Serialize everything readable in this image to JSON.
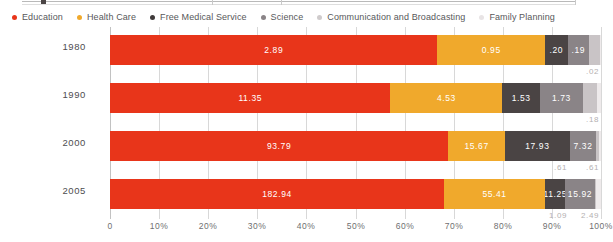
{
  "chart_data": {
    "type": "bar",
    "subtype": "stacked-horizontal-100pct",
    "title": "",
    "xlabel": "",
    "ylabel": "",
    "xlim": [
      0,
      100
    ],
    "xticks": [
      "0",
      "10%",
      "20%",
      "30%",
      "40%",
      "50%",
      "60%",
      "70%",
      "80%",
      "90%",
      "100%"
    ],
    "grid": true,
    "legend_position": "top",
    "categories": [
      "1980",
      "1990",
      "2000",
      "2005"
    ],
    "series": [
      {
        "name": "Education",
        "color": "#e8351a",
        "values": [
          2.89,
          11.35,
          93.79,
          182.94
        ],
        "labels": [
          "2.89",
          "11.35",
          "93.79",
          "182.94"
        ],
        "percents": [
          66.7,
          57.4,
          70.4,
          72.3
        ]
      },
      {
        "name": "Health Care",
        "color": "#f0a92c",
        "values": [
          0.95,
          4.53,
          15.67,
          55.41
        ],
        "labels": [
          "0.95",
          "4.53",
          "15.67",
          "55.41"
        ],
        "percents": [
          21.9,
          22.9,
          11.8,
          21.9
        ]
      },
      {
        "name": "Free Medical Service",
        "color": "#4a4444",
        "values": [
          0.2,
          1.53,
          17.93,
          11.25
        ],
        "labels": [
          ".20",
          "1.53",
          "17.93",
          "11.25"
        ],
        "percents": [
          4.6,
          7.7,
          13.5,
          4.4
        ]
      },
      {
        "name": "Science",
        "color": "#8a8487",
        "values": [
          0.19,
          1.73,
          7.32,
          15.92
        ],
        "labels": [
          ".19",
          "1.73",
          "7.32",
          "15.92"
        ],
        "percents": [
          4.4,
          8.8,
          5.5,
          6.3
        ]
      },
      {
        "name": "Communication and Broadcasting",
        "color": "#c9c4c6",
        "values": [
          0.1,
          0.56,
          0.61,
          1.09
        ],
        "labels": [
          ".10",
          ".56",
          ".61",
          "1.09"
        ],
        "percents": [
          2.3,
          2.8,
          0.5,
          0.4
        ]
      },
      {
        "name": "Family Planning",
        "color": "#eeeaeb",
        "values": [
          0.02,
          0.18,
          0.61,
          2.49
        ],
        "labels": [
          ".02",
          ".18",
          ".61",
          "2.49"
        ],
        "percents": [
          0.1,
          0.9,
          0.5,
          1.0
        ]
      }
    ],
    "overflow_labels": [
      {
        "row": "1980",
        "labels": [
          ".02"
        ]
      },
      {
        "row": "1990",
        "labels": [
          ".18"
        ]
      },
      {
        "row": "2000",
        "labels": [
          ".61",
          ".61"
        ]
      },
      {
        "row": "2005",
        "labels": [
          "1.09",
          "2.49"
        ]
      }
    ]
  },
  "legend": {
    "items": [
      {
        "label": "Education",
        "color": "#e8351a"
      },
      {
        "label": "Health Care",
        "color": "#f0a92c"
      },
      {
        "label": "Free Medical Service",
        "color": "#3f3a3a"
      },
      {
        "label": "Science",
        "color": "#8a8487"
      },
      {
        "label": "Communication and Broadcasting",
        "color": "#cfcbcc"
      },
      {
        "label": "Family Planning",
        "color": "#e8e4e5"
      }
    ]
  },
  "axis": {
    "x_ticks": [
      "0",
      "10%",
      "20%",
      "30%",
      "40%",
      "50%",
      "60%",
      "70%",
      "80%",
      "90%",
      "100%"
    ],
    "y_labels": [
      "1980",
      "1990",
      "2000",
      "2005"
    ]
  }
}
